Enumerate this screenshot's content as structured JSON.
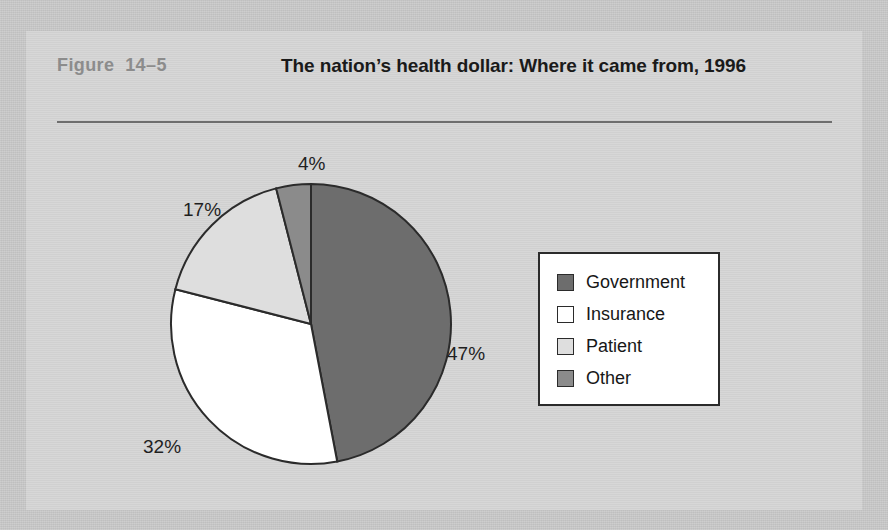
{
  "figure": {
    "number_label": "Figure  14–5",
    "title": "The nation’s health dollar: Where it came from, 1996"
  },
  "chart_data": {
    "type": "pie",
    "title": "The nation’s health dollar: Where it came from, 1996",
    "categories": [
      "Government",
      "Insurance",
      "Patient",
      "Other"
    ],
    "values": [
      47,
      32,
      17,
      4
    ],
    "value_unit": "percent",
    "data_labels": [
      "47%",
      "32%",
      "17%",
      "4%"
    ],
    "colors": [
      "#6d6d6d",
      "#ffffff",
      "#dedede",
      "#8b8b8b"
    ],
    "start_angle_deg": 0,
    "direction": "clockwise",
    "legend_position": "right",
    "legend_entries": [
      {
        "label": "Government",
        "color": "#6d6d6d",
        "value": 47
      },
      {
        "label": "Insurance",
        "color": "#ffffff",
        "value": 32
      },
      {
        "label": "Patient",
        "color": "#dedede",
        "value": 17
      },
      {
        "label": "Other",
        "color": "#8b8b8b",
        "value": 4
      }
    ]
  },
  "palette": {
    "page_background": "#c9c9c9",
    "panel_background": "#d5d5d5",
    "rule": "#6e6e6e",
    "figure_number_text": "#8c8c8c",
    "title_text": "#1a1a1a",
    "outline": "#2b2b2b"
  }
}
